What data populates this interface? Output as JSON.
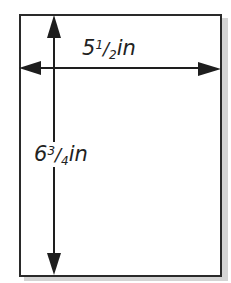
{
  "diagram": {
    "type": "page-dimensions",
    "colors": {
      "line": "#2a2a2a",
      "shadow": "#d4d4d4",
      "page": "#ffffff"
    },
    "width_label": {
      "whole": "5",
      "numerator": "1",
      "slash": "/",
      "denominator": "2",
      "unit": "in"
    },
    "height_label": {
      "whole": "6",
      "numerator": "3",
      "slash": "/",
      "denominator": "4",
      "unit": "in"
    }
  }
}
